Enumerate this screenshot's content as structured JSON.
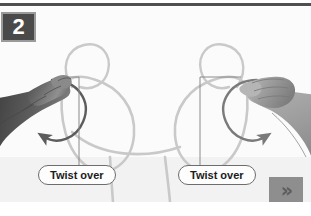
{
  "figure": {
    "step_number": "2",
    "kind": "instructional-illustration",
    "canvas": {
      "width": 311,
      "height": 216
    }
  },
  "callouts": [
    {
      "id": "left",
      "label": "Twist over"
    },
    {
      "id": "right",
      "label": "Twist over"
    }
  ],
  "navigation": {
    "next_glyph": "»",
    "next_icon_name": "double-chevron-right-icon"
  },
  "icons": {
    "rotate_left": "curved-arrow-counterclockwise-icon",
    "rotate_right": "curved-arrow-clockwise-icon",
    "left_hand": "left-hand-photo",
    "right_hand": "right-hand-photo",
    "cord": "looped-cord-illustration"
  },
  "colors": {
    "badge_fill": "#4a4a4a",
    "badge_border": "#9a9a9a",
    "badge_text": "#ffffff",
    "top_rule": "#4f4f4f",
    "panel_background": "#fbfbfb",
    "cord_stroke": "#c9c9c9",
    "arrow_stroke": "#767676",
    "leader_line": "#8a8a8a",
    "callout_border": "#6d6d6d",
    "callout_fill": "#fdfdfd",
    "callout_text": "#1b1b1b",
    "next_box": "#8e8e8e",
    "next_chevron": "#5d5d5d",
    "left_hand_tone": "#6f6f6f",
    "right_hand_tone": "#a8a8a8"
  }
}
